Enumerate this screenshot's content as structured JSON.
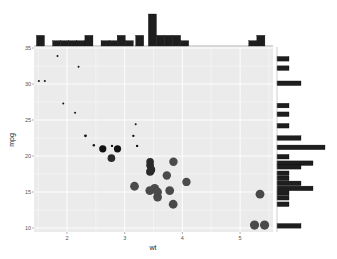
{
  "chart_data": {
    "type": "scatter",
    "title": "",
    "xlabel": "wt",
    "ylabel": "mpg",
    "xlim": [
      1.4,
      5.55
    ],
    "ylim": [
      9.5,
      35.5
    ],
    "xticks": [
      2,
      3,
      4,
      5
    ],
    "yticks": [
      10,
      15,
      20,
      25,
      30,
      35
    ],
    "grid": true,
    "legend": "none",
    "size_encoding": "point size increases as mpg decreases (darker/larger for heavier cars)",
    "points": [
      {
        "x": 2.62,
        "y": 21.0,
        "r": 3.6
      },
      {
        "x": 2.875,
        "y": 21.0,
        "r": 3.6
      },
      {
        "x": 2.32,
        "y": 22.8,
        "r": 1.4
      },
      {
        "x": 3.215,
        "y": 21.4,
        "r": 1.2
      },
      {
        "x": 3.44,
        "y": 18.7,
        "r": 3.8
      },
      {
        "x": 3.46,
        "y": 18.1,
        "r": 4.0
      },
      {
        "x": 3.57,
        "y": 14.3,
        "r": 4.4
      },
      {
        "x": 3.19,
        "y": 24.4,
        "r": 1.0
      },
      {
        "x": 3.15,
        "y": 22.8,
        "r": 1.2
      },
      {
        "x": 3.44,
        "y": 19.2,
        "r": 3.8
      },
      {
        "x": 3.44,
        "y": 17.8,
        "r": 4.0
      },
      {
        "x": 4.07,
        "y": 16.4,
        "r": 4.2
      },
      {
        "x": 3.73,
        "y": 17.3,
        "r": 4.2
      },
      {
        "x": 3.78,
        "y": 15.2,
        "r": 4.4
      },
      {
        "x": 5.25,
        "y": 10.4,
        "r": 4.6
      },
      {
        "x": 5.424,
        "y": 10.4,
        "r": 4.6
      },
      {
        "x": 5.345,
        "y": 14.7,
        "r": 4.4
      },
      {
        "x": 2.2,
        "y": 32.4,
        "r": 1.0
      },
      {
        "x": 1.615,
        "y": 30.4,
        "r": 1.0
      },
      {
        "x": 1.835,
        "y": 33.9,
        "r": 1.0
      },
      {
        "x": 2.465,
        "y": 21.5,
        "r": 1.2
      },
      {
        "x": 3.52,
        "y": 15.5,
        "r": 4.4
      },
      {
        "x": 3.435,
        "y": 15.2,
        "r": 4.4
      },
      {
        "x": 3.84,
        "y": 13.3,
        "r": 4.4
      },
      {
        "x": 3.845,
        "y": 19.2,
        "r": 4.2
      },
      {
        "x": 1.935,
        "y": 27.3,
        "r": 1.0
      },
      {
        "x": 2.14,
        "y": 26.0,
        "r": 1.0
      },
      {
        "x": 1.513,
        "y": 30.4,
        "r": 1.0
      },
      {
        "x": 3.17,
        "y": 15.8,
        "r": 4.4
      },
      {
        "x": 2.77,
        "y": 19.7,
        "r": 3.8
      },
      {
        "x": 3.57,
        "y": 15.0,
        "r": 4.4
      },
      {
        "x": 2.78,
        "y": 21.4,
        "r": 1.2
      }
    ],
    "marginal_x_histogram": {
      "bin_width": 0.14,
      "bins": [
        {
          "x0": 1.47,
          "count": 2
        },
        {
          "x0": 1.61,
          "count": 0
        },
        {
          "x0": 1.75,
          "count": 1
        },
        {
          "x0": 1.89,
          "count": 1
        },
        {
          "x0": 2.03,
          "count": 1
        },
        {
          "x0": 2.17,
          "count": 1
        },
        {
          "x0": 2.31,
          "count": 2
        },
        {
          "x0": 2.45,
          "count": 0
        },
        {
          "x0": 2.59,
          "count": 1
        },
        {
          "x0": 2.73,
          "count": 1
        },
        {
          "x0": 2.87,
          "count": 2
        },
        {
          "x0": 3.01,
          "count": 1
        },
        {
          "x0": 3.15,
          "count": 0
        },
        {
          "x0": 3.19,
          "count": 2
        },
        {
          "x0": 3.05,
          "count": 0
        },
        {
          "x0": 3.33,
          "count": 0
        },
        {
          "x0": 3.41,
          "count": 6
        },
        {
          "x0": 3.55,
          "count": 2
        },
        {
          "x0": 3.69,
          "count": 2
        },
        {
          "x0": 3.83,
          "count": 2
        },
        {
          "x0": 3.97,
          "count": 1
        },
        {
          "x0": 5.15,
          "count": 1
        },
        {
          "x0": 5.29,
          "count": 2
        }
      ],
      "max_count": 6
    },
    "marginal_y_histogram": {
      "bins": [
        {
          "y0": 33.5,
          "count": 1
        },
        {
          "y0": 32.2,
          "count": 1
        },
        {
          "y0": 30.1,
          "count": 2
        },
        {
          "y0": 27.0,
          "count": 1
        },
        {
          "y0": 25.8,
          "count": 1
        },
        {
          "y0": 24.2,
          "count": 1
        },
        {
          "y0": 22.5,
          "count": 2
        },
        {
          "y0": 21.2,
          "count": 4
        },
        {
          "y0": 19.9,
          "count": 1
        },
        {
          "y0": 19.0,
          "count": 3
        },
        {
          "y0": 18.5,
          "count": 2
        },
        {
          "y0": 17.6,
          "count": 1
        },
        {
          "y0": 16.9,
          "count": 1
        },
        {
          "y0": 16.2,
          "count": 2
        },
        {
          "y0": 15.5,
          "count": 3
        },
        {
          "y0": 14.9,
          "count": 1
        },
        {
          "y0": 14.2,
          "count": 1
        },
        {
          "y0": 13.3,
          "count": 1
        },
        {
          "y0": 10.3,
          "count": 2
        }
      ],
      "max_count": 4
    }
  },
  "labels": {
    "xlabel": "wt",
    "ylabel": "mpg"
  },
  "colors": {
    "panel_bg": "#ebebeb",
    "grid": "#ffffff",
    "point": "#1a1a1a",
    "hist_bar": "#1e1e1e"
  }
}
